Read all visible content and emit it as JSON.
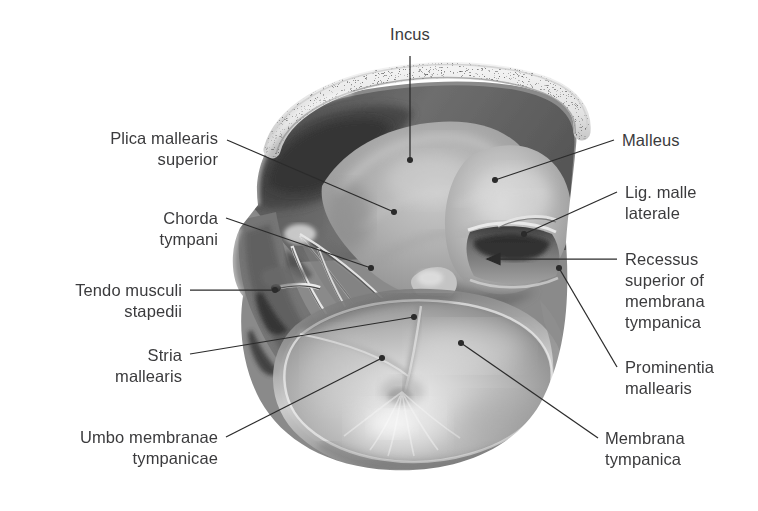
{
  "figure": {
    "kind": "anatomical-illustration",
    "style": "grayscale halftone anatomical drawing",
    "background_color": "#ffffff",
    "label_color": "#3b3b3d",
    "leader_color": "#2b2b2b"
  },
  "labels": [
    {
      "id": "incus",
      "text": "Incus",
      "align": "center",
      "x": 410,
      "y": 24,
      "width": 120,
      "leader": [
        [
          410,
          56
        ],
        [
          410,
          160
        ]
      ],
      "pointer": "dot"
    },
    {
      "id": "plica-mallearis-superior",
      "text": "Plica mallearis\nsuperior",
      "align": "right",
      "x": 40,
      "y": 128,
      "width": 178,
      "leader": [
        [
          227,
          140
        ],
        [
          394,
          212
        ]
      ],
      "pointer": "dot"
    },
    {
      "id": "chorda-tympani",
      "text": "Chorda\ntympani",
      "align": "right",
      "x": 40,
      "y": 208,
      "width": 178,
      "leader": [
        [
          226,
          218
        ],
        [
          371,
          268
        ]
      ],
      "pointer": "dot"
    },
    {
      "id": "tendo-musculi-stapedii",
      "text": "Tendo musculi\nstapedii",
      "align": "right",
      "x": 10,
      "y": 280,
      "width": 172,
      "leader": [
        [
          190,
          290
        ],
        [
          275,
          290
        ]
      ],
      "pointer": "dot"
    },
    {
      "id": "stria-mallearis",
      "text": "Stria\nmallearis",
      "align": "right",
      "x": 10,
      "y": 345,
      "width": 172,
      "leader": [
        [
          190,
          354
        ],
        [
          414,
          317
        ]
      ],
      "pointer": "dot"
    },
    {
      "id": "umbo-membranae-tympanicae",
      "text": "Umbo membranae\ntympanicae",
      "align": "right",
      "x": 10,
      "y": 427,
      "width": 208,
      "leader": [
        [
          226,
          437
        ],
        [
          382,
          358
        ]
      ],
      "pointer": "dot"
    },
    {
      "id": "malleus",
      "text": "Malleus",
      "align": "left",
      "x": 622,
      "y": 130,
      "width": 130,
      "leader": [
        [
          614,
          140
        ],
        [
          495,
          180
        ]
      ],
      "pointer": "dot"
    },
    {
      "id": "lig-malle-laterale",
      "text": "Lig. malle\nlaterale",
      "align": "left",
      "x": 625,
      "y": 182,
      "width": 130,
      "leader": [
        [
          617,
          192
        ],
        [
          524,
          234
        ]
      ],
      "pointer": "dot"
    },
    {
      "id": "recessus-superior-membranae-tympanicae",
      "text": "Recessus\nsuperior of\nmembrana\ntympanica",
      "align": "left",
      "x": 625,
      "y": 249,
      "width": 130,
      "leader": [
        [
          617,
          259
        ],
        [
          487,
          259
        ]
      ],
      "pointer": "arrow"
    },
    {
      "id": "prominentia-mallearis",
      "text": "Prominentia\nmallearis",
      "align": "left",
      "x": 625,
      "y": 357,
      "width": 130,
      "leader": [
        [
          617,
          367
        ],
        [
          559,
          268
        ]
      ],
      "pointer": "dot"
    },
    {
      "id": "membrana-tympanica",
      "text": "Membrana\ntympanica",
      "align": "left",
      "x": 605,
      "y": 428,
      "width": 140,
      "leader": [
        [
          598,
          438
        ],
        [
          461,
          343
        ]
      ],
      "pointer": "dot"
    }
  ]
}
